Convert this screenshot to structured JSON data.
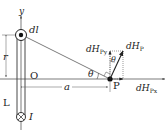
{
  "diagram": {
    "labels": {
      "y_axis": "y",
      "x_axis": "x",
      "element": "dl",
      "distance_r": "r",
      "origin": "O",
      "wire": "L",
      "current": "I",
      "distance_a": "a",
      "point": "P",
      "angle_theta_left": "θ",
      "angle_theta_right": "θ",
      "field_y": "dH",
      "field_y_sub": "Py",
      "field_total": "dH",
      "field_total_sub": "P",
      "field_x": "dH",
      "field_x_sub": "Px"
    },
    "colors": {
      "line": "#333333",
      "dotted": "#555555",
      "background": "#ffffff"
    }
  }
}
